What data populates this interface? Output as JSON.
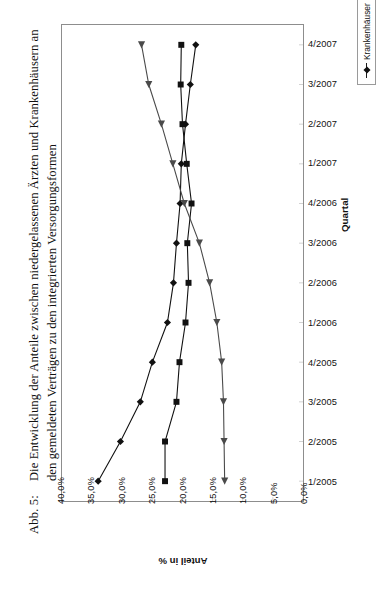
{
  "figure": {
    "label": "Abb. 5:",
    "caption": "Die Entwicklung der Anteile zwischen niedergelassenen Ärzten und Krankenhäusern an den gemeldeten Verträgen zu den integrierten Versorgungsformen"
  },
  "chart_data": {
    "type": "line",
    "orientation": "rotated-90",
    "title": "Die Entwicklung der Anteile zwischen niedergelassenen Ärzten und Krankenhäusern an den gemeldeten Verträgen zu den integrierten Versorgungsformen",
    "xlabel": "Quartal",
    "ylabel": "Anteil in %",
    "categories": [
      "1/2005",
      "2/2005",
      "3/2005",
      "4/2005",
      "1/2006",
      "2/2006",
      "3/2006",
      "4/2006",
      "1/2007",
      "2/2007",
      "3/2007",
      "4/2007"
    ],
    "ylim": [
      0,
      40
    ],
    "yticks": [
      "0,0%",
      "5,0%",
      "10,0%",
      "15,0%",
      "20,0%",
      "25,0%",
      "30,0%",
      "35,0%",
      "40,0%"
    ],
    "ytick_values": [
      0,
      5,
      10,
      15,
      20,
      25,
      30,
      35,
      40
    ],
    "grid": false,
    "legend_position": "right",
    "series": [
      {
        "name": "Krankenhäuser",
        "marker": "diamond",
        "color": "#111111",
        "values": [
          34.0,
          30.3,
          27.0,
          25.0,
          22.5,
          21.5,
          21.0,
          20.4,
          20.2,
          19.5,
          18.7,
          17.8
        ]
      },
      {
        "name": "Niedergelassene Ärzte/Krankenhäuser",
        "marker": "square",
        "color": "#111111",
        "values": [
          22.9,
          22.9,
          21.0,
          20.5,
          19.5,
          19.0,
          19.2,
          18.5,
          19.3,
          20.0,
          20.3,
          20.2
        ]
      },
      {
        "name": "Niedergelassene Ärzte",
        "marker": "triangle",
        "color": "#4a4a4a",
        "values": [
          13.0,
          13.1,
          13.2,
          13.5,
          14.3,
          15.5,
          17.2,
          19.7,
          21.6,
          23.5,
          25.6,
          26.8
        ]
      }
    ]
  },
  "legend": {
    "items": [
      {
        "label": "Krankenhäuser",
        "marker": "diamond-marker"
      },
      {
        "label": "Niedergelassene Ärzte/Krankenhäuser",
        "marker": "square-marker"
      },
      {
        "label": "Niedergelassene Ärzte",
        "marker": "triangle-marker"
      }
    ]
  }
}
